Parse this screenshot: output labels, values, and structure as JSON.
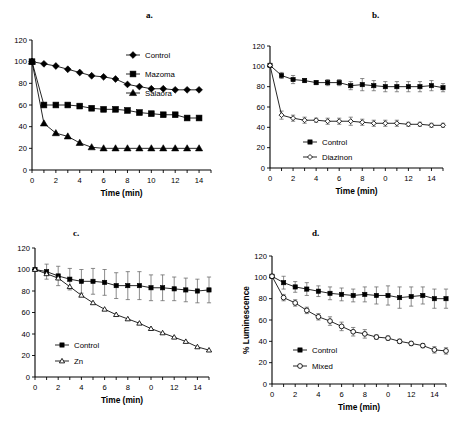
{
  "figure": {
    "panels": [
      {
        "id": "a",
        "label": "a.",
        "chart_data": {
          "type": "line",
          "title": "a.",
          "xlabel": "Time (min)",
          "ylabel": "",
          "xlim": [
            0,
            15
          ],
          "ylim": [
            0,
            120
          ],
          "xticks": [
            0,
            2,
            4,
            6,
            8,
            10,
            12,
            14
          ],
          "xticklabels": [
            "0",
            "2",
            "4",
            "6",
            "8",
            "10",
            "12",
            "14"
          ],
          "yticks": [
            0,
            20,
            40,
            60,
            80,
            100,
            120
          ],
          "yticklabels": [
            "120",
            "100",
            "80",
            "60",
            "40",
            "20",
            "0"
          ],
          "grid": false,
          "legend_position": "upper-right",
          "errorbars": false,
          "x": [
            0,
            1,
            2,
            3,
            4,
            5,
            6,
            7,
            8,
            9,
            10,
            11,
            12,
            13,
            14
          ],
          "series": [
            {
              "name": "Control",
              "marker": "filled-diamond",
              "values": [
                100,
                98,
                96,
                93,
                90,
                87,
                86,
                84,
                79,
                77,
                75,
                75,
                74,
                74,
                74
              ]
            },
            {
              "name": "Mazoma",
              "marker": "filled-square",
              "values": [
                100,
                60,
                60,
                60,
                59,
                57,
                56,
                56,
                55,
                53,
                52,
                51,
                51,
                48,
                48
              ]
            },
            {
              "name": "Salaora",
              "marker": "filled-triangle",
              "values": [
                100,
                43,
                34,
                31,
                25,
                21,
                20,
                20,
                20,
                20,
                20,
                20,
                20,
                20,
                20
              ]
            }
          ]
        }
      },
      {
        "id": "b",
        "label": "b.",
        "chart_data": {
          "type": "line",
          "title": "b.",
          "xlabel": "Time (min)",
          "ylabel": "",
          "xlim": [
            0,
            15
          ],
          "ylim": [
            0,
            120
          ],
          "xticks": [
            0,
            2,
            4,
            6,
            8,
            10,
            12,
            14
          ],
          "xticklabels": [
            "0",
            "2",
            "4",
            "6",
            "8",
            "0",
            "12",
            "14"
          ],
          "yticks": [
            0,
            20,
            40,
            60,
            80,
            100,
            120
          ],
          "yticklabels": [
            "120",
            "100",
            "80",
            "60",
            "40",
            "20",
            "0"
          ],
          "grid": false,
          "legend_position": "lower-left",
          "errorbars": true,
          "x": [
            0,
            1,
            2,
            3,
            4,
            5,
            6,
            7,
            8,
            9,
            10,
            11,
            12,
            13,
            14,
            15
          ],
          "series": [
            {
              "name": "Control",
              "marker": "filled-square",
              "values": [
                101,
                91,
                87,
                86,
                84,
                84,
                84,
                81,
                82,
                81,
                80,
                80,
                80,
                80,
                81,
                79
              ],
              "errors": [
                1,
                3,
                4,
                2,
                2,
                3,
                3,
                4,
                6,
                5,
                5,
                5,
                5,
                5,
                5,
                4
              ]
            },
            {
              "name": "Diazinon",
              "marker": "open-diamond",
              "values": [
                101,
                52,
                49,
                47,
                47,
                46,
                46,
                46,
                45,
                44,
                44,
                44,
                43,
                43,
                42,
                42
              ],
              "errors": [
                1,
                4,
                3,
                3,
                2,
                3,
                3,
                4,
                3,
                3,
                3,
                3,
                2,
                2,
                2,
                2
              ]
            }
          ]
        }
      },
      {
        "id": "c",
        "label": "c.",
        "chart_data": {
          "type": "line",
          "title": "c.",
          "xlabel": "Time (min)",
          "ylabel": "",
          "xlim": [
            0,
            15
          ],
          "ylim": [
            0,
            120
          ],
          "xticks": [
            0,
            2,
            4,
            6,
            8,
            10,
            12,
            14
          ],
          "xticklabels": [
            "0",
            "2",
            "4",
            "6",
            "8",
            "0",
            "12",
            "14"
          ],
          "yticks": [
            0,
            20,
            40,
            60,
            80,
            100,
            120
          ],
          "yticklabels": [
            "120",
            "100",
            "80",
            "60",
            "40",
            "20",
            "0"
          ],
          "grid": false,
          "legend_position": "lower-left",
          "errorbars": true,
          "x": [
            0,
            1,
            2,
            3,
            4,
            5,
            6,
            7,
            8,
            9,
            10,
            11,
            12,
            13,
            14,
            15
          ],
          "series": [
            {
              "name": "Control",
              "marker": "filled-square",
              "values": [
                100,
                98,
                94,
                91,
                89,
                89,
                88,
                85,
                85,
                85,
                83,
                83,
                82,
                81,
                80,
                81
              ],
              "errors": [
                1,
                7,
                9,
                10,
                11,
                12,
                12,
                12,
                13,
                13,
                12,
                12,
                11,
                11,
                11,
                12
              ]
            },
            {
              "name": "Zn",
              "marker": "open-triangle",
              "values": [
                100,
                96,
                92,
                84,
                76,
                69,
                63,
                58,
                54,
                50,
                45,
                41,
                37,
                33,
                28,
                25
              ]
            }
          ]
        }
      },
      {
        "id": "d",
        "label": "d.",
        "chart_data": {
          "type": "line",
          "title": "d.",
          "xlabel": "Time (min)",
          "ylabel": "% Luminescence",
          "xlim": [
            0,
            15
          ],
          "ylim": [
            0,
            120
          ],
          "xticks": [
            0,
            2,
            4,
            6,
            8,
            10,
            12,
            14
          ],
          "xticklabels": [
            "0",
            "2",
            "4",
            "6",
            "8",
            "0",
            "12",
            "14"
          ],
          "yticks": [
            0,
            20,
            40,
            60,
            80,
            100,
            120
          ],
          "yticklabels": [
            "120",
            "100",
            "80",
            "60",
            "40",
            "20",
            "0"
          ],
          "grid": false,
          "legend_position": "lower-left",
          "errorbars": true,
          "x": [
            0,
            1,
            2,
            3,
            4,
            5,
            6,
            7,
            8,
            9,
            10,
            11,
            12,
            13,
            14,
            15
          ],
          "series": [
            {
              "name": "Control",
              "marker": "filled-square",
              "values": [
                101,
                95,
                91,
                89,
                87,
                85,
                84,
                83,
                84,
                83,
                83,
                81,
                82,
                83,
                80,
                80
              ],
              "errors": [
                1,
                6,
                5,
                6,
                5,
                6,
                6,
                6,
                7,
                8,
                9,
                10,
                9,
                8,
                9,
                9
              ]
            },
            {
              "name": "Mixed",
              "marker": "open-circle",
              "values": [
                101,
                81,
                76,
                69,
                63,
                59,
                54,
                49,
                47,
                44,
                43,
                40,
                38,
                36,
                32,
                31
              ],
              "errors": [
                1,
                3,
                3,
                3,
                3,
                4,
                4,
                4,
                4,
                2,
                2,
                2,
                2,
                2,
                3,
                3
              ]
            }
          ]
        }
      }
    ]
  }
}
